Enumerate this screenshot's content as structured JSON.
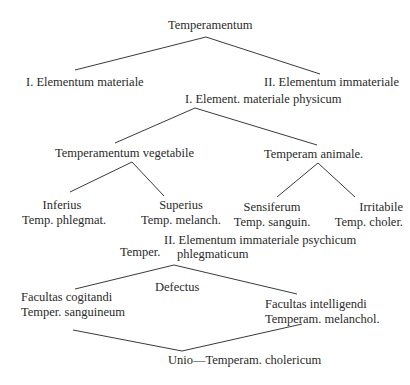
{
  "diagram": {
    "root": "Temperamentum",
    "level1": {
      "left": "I. Elementum materiale",
      "right": "II. Elementum immateriale"
    },
    "physicum": {
      "title": "I. Element. materiale physicum",
      "vegetabile": {
        "title": "Temperamentum vegetabile",
        "inferius": {
          "line1": "Inferius",
          "line2": "Temp. phlegmat."
        },
        "superius": {
          "line1": "Superius",
          "line2": "Temp. melanch."
        }
      },
      "animale": {
        "title": "Temperam animale.",
        "sensiferum": {
          "line1": "Sensiferum",
          "line2": "Temp. sanguin."
        },
        "irritabile": {
          "line1": "Irritabile",
          "line2": "Temp. choler."
        }
      }
    },
    "psychicum": {
      "title": "II. Elementum immateriale psychicum",
      "temper_prefix": "Temper.",
      "temper_value": "phlegmaticum",
      "defectus": "Defectus",
      "cogitandi": {
        "line1": "Facultas cogitandi",
        "line2": "Temper. sanguineum"
      },
      "intelligendi": {
        "line1": "Facultas intelligendi",
        "line2": "Temperam. melanchol."
      },
      "unio": "Unio—Temperam. cholericum"
    }
  }
}
